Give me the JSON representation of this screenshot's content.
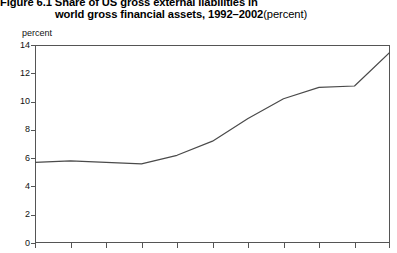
{
  "title": {
    "line1": "Figure 6.1  Share of US gross external liabilities in",
    "line2": "world gross financial assets, 1992–2002",
    "unit_suffix": "(percent)"
  },
  "axis": {
    "y_unit_label": "percent",
    "y_ticks": [
      "14",
      "12",
      "10",
      "8",
      "6",
      "4",
      "2",
      "0"
    ]
  },
  "chart_data": {
    "type": "line",
    "xlabel": "",
    "ylabel": "percent",
    "ylim": [
      0,
      14
    ],
    "ytick_values": [
      0,
      2,
      4,
      6,
      8,
      10,
      12,
      14
    ],
    "grid": false,
    "legend": "none",
    "line_color": "#4a4a4a",
    "x": [
      1992,
      1993,
      1994,
      1995,
      1996,
      1997,
      1998,
      1999,
      2000,
      2001,
      2002
    ],
    "categories": [
      "1992",
      "1993",
      "1994",
      "1995",
      "1996",
      "1997",
      "1998",
      "1999",
      "2000",
      "2001",
      "2002"
    ],
    "values": [
      5.7,
      5.8,
      5.7,
      5.6,
      6.2,
      7.2,
      8.8,
      10.2,
      11.0,
      11.1,
      13.5
    ],
    "series": [
      {
        "name": "US gross external liabilities share",
        "values": [
          5.7,
          5.8,
          5.7,
          5.6,
          6.2,
          7.2,
          8.8,
          10.2,
          11.0,
          11.1,
          13.5
        ]
      }
    ],
    "note": "x-axis tick labels are cropped below the visible image area"
  }
}
